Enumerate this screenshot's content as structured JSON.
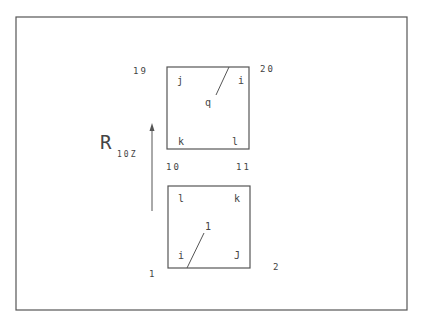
{
  "diagram": {
    "frame": {
      "x": 16,
      "y": 17,
      "width": 391,
      "height": 293
    },
    "stroke_color": "#555555",
    "text_color": "#444444",
    "rotation_label": {
      "main": "R",
      "subscript": "10Z",
      "x": 100,
      "y": 149
    },
    "arrow": {
      "x": 152,
      "y_start": 211,
      "y_end": 123
    },
    "elements": [
      {
        "id": "element-bottom",
        "label": "1",
        "box": {
          "x": 168,
          "y": 186,
          "width": 82,
          "height": 82
        },
        "leader": {
          "x1": 187,
          "y1": 268,
          "x2": 204,
          "y2": 233
        },
        "label_pos": {
          "x": 205,
          "y": 230
        },
        "axis_labels": [
          {
            "text": "l",
            "x": 178,
            "y": 202
          },
          {
            "text": "k",
            "x": 234,
            "y": 202
          },
          {
            "text": "i",
            "x": 178,
            "y": 259
          },
          {
            "text": "J",
            "x": 234,
            "y": 259
          }
        ],
        "nodes": [
          {
            "text": "1",
            "x": 149,
            "y": 277
          },
          {
            "text": "2",
            "x": 273,
            "y": 270
          }
        ]
      },
      {
        "id": "element-top",
        "label": "q",
        "box": {
          "x": 167,
          "y": 67,
          "width": 82,
          "height": 82
        },
        "leader": {
          "x1": 229,
          "y1": 67,
          "x2": 216,
          "y2": 95
        },
        "label_pos": {
          "x": 205,
          "y": 106
        },
        "axis_labels": [
          {
            "text": "j",
            "x": 177,
            "y": 84
          },
          {
            "text": "i",
            "x": 238,
            "y": 84
          },
          {
            "text": "k",
            "x": 178,
            "y": 145
          },
          {
            "text": "l",
            "x": 232,
            "y": 145
          }
        ],
        "nodes": [
          {
            "text": "19",
            "x": 133,
            "y": 74
          },
          {
            "text": "20",
            "x": 260,
            "y": 72
          },
          {
            "text": "10",
            "x": 166,
            "y": 170
          },
          {
            "text": "11",
            "x": 236,
            "y": 170
          }
        ]
      }
    ]
  }
}
